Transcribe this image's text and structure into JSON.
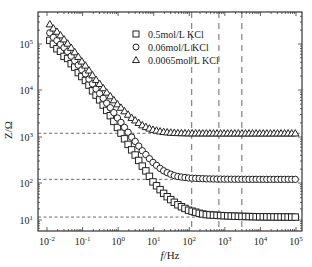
{
  "chart_data": {
    "type": "scatter",
    "title": "",
    "xlabel": "f/Hz",
    "ylabel": "Z/Ω",
    "xscale": "log",
    "yscale": "log",
    "xlim": [
      0.006,
      130000
    ],
    "ylim": [
      7,
      400000
    ],
    "x_ticks": [
      "10^-2",
      "10^-1",
      "10^0",
      "10^1",
      "10^2",
      "10^3",
      "10^4",
      "10^5"
    ],
    "y_ticks": [
      "10^1",
      "10^2",
      "10^3",
      "10^4",
      "10^5"
    ],
    "grid": false,
    "legend_position": "upper-right-inside",
    "reference_lines": {
      "horizontal": [
        1200,
        120,
        12
      ],
      "vertical": [
        117,
        680,
        3000
      ]
    },
    "series": [
      {
        "name": "0.5mol/L KCl",
        "marker": "square",
        "plateau": 12,
        "points": [
          [
            0.012,
            120000
          ],
          [
            0.015,
            100000
          ],
          [
            0.02,
            75000
          ],
          [
            0.025,
            68000
          ],
          [
            0.032,
            50000
          ],
          [
            0.04,
            48000
          ],
          [
            0.05,
            35000
          ],
          [
            0.065,
            30000
          ],
          [
            0.08,
            22000
          ],
          [
            0.1,
            19000
          ],
          [
            0.13,
            15000
          ],
          [
            0.16,
            12000
          ],
          [
            0.2,
            9000
          ],
          [
            0.25,
            7500
          ],
          [
            0.32,
            5800
          ],
          [
            0.4,
            4500
          ],
          [
            0.5,
            3500
          ],
          [
            0.65,
            2600
          ],
          [
            0.8,
            2000
          ],
          [
            1,
            1500
          ],
          [
            1.3,
            1100
          ],
          [
            1.6,
            850
          ],
          [
            2,
            650
          ],
          [
            2.5,
            500
          ],
          [
            3.2,
            380
          ],
          [
            4,
            290
          ],
          [
            5,
            220
          ],
          [
            6.5,
            170
          ],
          [
            8,
            130
          ],
          [
            10,
            100
          ],
          [
            13,
            78
          ],
          [
            16,
            62
          ],
          [
            20,
            50
          ],
          [
            25,
            41
          ],
          [
            32,
            34
          ],
          [
            40,
            29
          ],
          [
            50,
            25
          ],
          [
            65,
            22
          ],
          [
            80,
            20
          ],
          [
            100,
            18
          ],
          [
            130,
            17
          ],
          [
            160,
            16
          ],
          [
            200,
            15
          ],
          [
            300,
            14
          ],
          [
            500,
            13.5
          ],
          [
            1000,
            13
          ],
          [
            3000,
            12.5
          ],
          [
            10000,
            12.2
          ],
          [
            100000,
            12
          ]
        ]
      },
      {
        "name": "0.06mol/L KCl",
        "marker": "circle",
        "plateau": 120,
        "points": [
          [
            0.012,
            175000
          ],
          [
            0.015,
            140000
          ],
          [
            0.02,
            115000
          ],
          [
            0.025,
            95000
          ],
          [
            0.032,
            80000
          ],
          [
            0.04,
            65000
          ],
          [
            0.05,
            52000
          ],
          [
            0.065,
            40000
          ],
          [
            0.08,
            33000
          ],
          [
            0.1,
            26000
          ],
          [
            0.13,
            21000
          ],
          [
            0.16,
            16000
          ],
          [
            0.2,
            13000
          ],
          [
            0.25,
            10000
          ],
          [
            0.32,
            8000
          ],
          [
            0.4,
            6300
          ],
          [
            0.5,
            5000
          ],
          [
            0.65,
            3900
          ],
          [
            0.8,
            3100
          ],
          [
            1,
            2400
          ],
          [
            1.3,
            1900
          ],
          [
            1.6,
            1500
          ],
          [
            2,
            1200
          ],
          [
            2.5,
            950
          ],
          [
            3.2,
            760
          ],
          [
            4,
            600
          ],
          [
            5,
            480
          ],
          [
            6.5,
            390
          ],
          [
            8,
            320
          ],
          [
            10,
            270
          ],
          [
            13,
            230
          ],
          [
            16,
            200
          ],
          [
            20,
            180
          ],
          [
            25,
            165
          ],
          [
            32,
            152
          ],
          [
            40,
            143
          ],
          [
            50,
            137
          ],
          [
            100,
            128
          ],
          [
            300,
            123
          ],
          [
            1000,
            121
          ],
          [
            10000,
            120
          ],
          [
            100000,
            120
          ]
        ]
      },
      {
        "name": "0.0065mol/L KCl",
        "marker": "triangle",
        "plateau": 1200,
        "points": [
          [
            0.012,
            270000
          ],
          [
            0.015,
            220000
          ],
          [
            0.02,
            180000
          ],
          [
            0.025,
            150000
          ],
          [
            0.032,
            120000
          ],
          [
            0.04,
            98000
          ],
          [
            0.05,
            80000
          ],
          [
            0.065,
            62000
          ],
          [
            0.08,
            50000
          ],
          [
            0.1,
            40000
          ],
          [
            0.13,
            32000
          ],
          [
            0.16,
            25000
          ],
          [
            0.2,
            20000
          ],
          [
            0.25,
            16000
          ],
          [
            0.32,
            13000
          ],
          [
            0.4,
            10500
          ],
          [
            0.5,
            8500
          ],
          [
            0.65,
            7000
          ],
          [
            0.8,
            5800
          ],
          [
            1,
            4800
          ],
          [
            1.3,
            4000
          ],
          [
            1.6,
            3400
          ],
          [
            2,
            2900
          ],
          [
            2.5,
            2500
          ],
          [
            3.2,
            2200
          ],
          [
            4,
            1950
          ],
          [
            5,
            1750
          ],
          [
            6.5,
            1600
          ],
          [
            8,
            1500
          ],
          [
            10,
            1420
          ],
          [
            13,
            1360
          ],
          [
            16,
            1310
          ],
          [
            20,
            1280
          ],
          [
            32,
            1240
          ],
          [
            50,
            1220
          ],
          [
            100,
            1205
          ],
          [
            1000,
            1200
          ],
          [
            10000,
            1200
          ],
          [
            100000,
            1200
          ]
        ]
      }
    ]
  },
  "axes": {
    "xlabel_italic": "f",
    "xlabel_rest": "/Hz",
    "ylabel": "Z/Ω",
    "x_tick_labels": [
      {
        "base": "10",
        "exp": "-2"
      },
      {
        "base": "10",
        "exp": "-1"
      },
      {
        "base": "10",
        "exp": "0"
      },
      {
        "base": "10",
        "exp": "1"
      },
      {
        "base": "10",
        "exp": "2"
      },
      {
        "base": "10",
        "exp": "3"
      },
      {
        "base": "10",
        "exp": "4"
      },
      {
        "base": "10",
        "exp": "5"
      }
    ],
    "y_tick_labels": [
      {
        "base": "10",
        "exp": "5"
      },
      {
        "base": "10",
        "exp": "4"
      },
      {
        "base": "10",
        "exp": "3"
      },
      {
        "base": "10",
        "exp": "2"
      },
      {
        "base": "10",
        "exp": "1"
      }
    ]
  },
  "legend": {
    "items": [
      {
        "label": "0.5mol/L KCl",
        "marker": "square"
      },
      {
        "label": "0.06mol/L KCl",
        "marker": "circle"
      },
      {
        "label": "0.0065mol/L KCl",
        "marker": "triangle"
      }
    ]
  },
  "colors": {
    "ink": "#222222",
    "background": "#ffffff"
  }
}
